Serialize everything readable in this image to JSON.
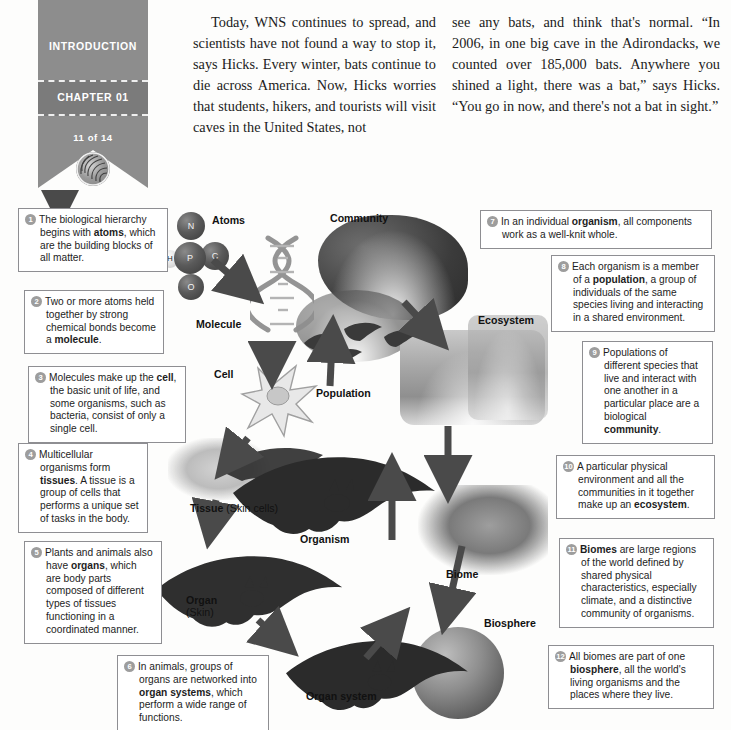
{
  "sidebar": {
    "section": "INTRODUCTION",
    "chapter": "CHAPTER 01",
    "page_counter": "11 of 14",
    "logo_name": "spiral-emblem"
  },
  "article": {
    "column_left": "Today, WNS continues to spread, and scientists have not found a way to stop it, says Hicks. Every winter, bats continue to die across America. Now, Hicks worries that students, hikers, and tourists will visit caves in the United States, not",
    "column_right": "see any bats, and think that's normal. “In 2006, in one big cave in the Adirondacks, we counted over 185,000 bats. Anywhere you shined a light, there was a bat,” says Hicks. “You go in now, and there's not a bat in sight.”"
  },
  "figure": {
    "callouts": [
      {
        "num": "1",
        "html": "The biological hierarchy begins with <b>atoms</b>, which are the building blocks of all matter."
      },
      {
        "num": "2",
        "html": "Two or more atoms held together by strong chemical bonds become a <b>molecule</b>."
      },
      {
        "num": "3",
        "html": "Molecules make up the <b>cell</b>, the basic unit of life, and some organisms, such as bacteria, consist of only a single cell."
      },
      {
        "num": "4",
        "html": "Multicellular organisms form <b>tissues</b>. A tissue is a group of cells that performs a unique set of tasks in the body."
      },
      {
        "num": "5",
        "html": "Plants and animals also have <b>organs</b>, which are body parts composed of different types of tissues functioning in a coordinated manner."
      },
      {
        "num": "6",
        "html": "In animals, groups of organs are networked into <b>organ systems</b>, which perform a wide range of functions."
      },
      {
        "num": "7",
        "html": "In an individual <b>organism</b>, all components work as a well-knit whole."
      },
      {
        "num": "8",
        "html": "Each organism is a member of a <b>population</b>, a group of individuals of the same species living and interacting in a shared environment."
      },
      {
        "num": "9",
        "html": "Populations of different species that live and interact with one another in a particular place are a biological <b>community</b>."
      },
      {
        "num": "10",
        "html": "A particular physical environment and all the communities in it together make up an <b>ecosystem</b>."
      },
      {
        "num": "11",
        "html": "<b>Biomes</b> are large regions of the world defined by shared physical characteristics, especially climate, and a distinctive community of organisms."
      },
      {
        "num": "12",
        "html": "All biomes are part of one <b>biosphere</b>, all the world's living organisms and the places where they live."
      }
    ],
    "stage_labels": [
      {
        "name": "atoms",
        "text": "Atoms"
      },
      {
        "name": "molecule",
        "text": "Molecule"
      },
      {
        "name": "cell",
        "text": "Cell"
      },
      {
        "name": "tissue",
        "text": "Tissue",
        "sub": " (Skin cells)"
      },
      {
        "name": "organ",
        "text": "Organ",
        "sub": "(Skin)"
      },
      {
        "name": "organ-system",
        "text": "Organ system"
      },
      {
        "name": "organism",
        "text": "Organism"
      },
      {
        "name": "population",
        "text": "Population"
      },
      {
        "name": "community",
        "text": "Community"
      },
      {
        "name": "ecosystem",
        "text": "Ecosystem"
      },
      {
        "name": "biome",
        "text": "Biome"
      },
      {
        "name": "biosphere",
        "text": "Biosphere"
      }
    ],
    "atoms": [
      {
        "symbol": "N"
      },
      {
        "symbol": "C"
      },
      {
        "symbol": "H"
      },
      {
        "symbol": "P"
      },
      {
        "symbol": "O"
      }
    ]
  },
  "colors": {
    "banner": "#8d8d8d",
    "banner_band": "#7b7b7b",
    "badge": "#9d9d9d",
    "callout_border": "#8e8e92",
    "text": "#1b1b1b"
  }
}
